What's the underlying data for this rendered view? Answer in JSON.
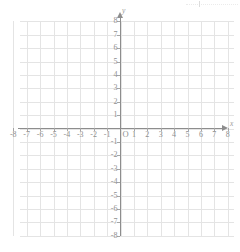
{
  "chart_data": {
    "type": "scatter",
    "title": "",
    "subtitle": "",
    "xlabel": "x",
    "ylabel": "y",
    "xlim": [
      -8,
      8
    ],
    "ylim": [
      -8,
      8
    ],
    "grid": true,
    "legend": null,
    "series": [],
    "x_ticks": [
      -8,
      -7,
      -6,
      -5,
      -4,
      -3,
      -2,
      -1,
      1,
      2,
      3,
      4,
      5,
      6,
      7,
      8
    ],
    "y_ticks": [
      8,
      7,
      6,
      5,
      4,
      3,
      2,
      1,
      -1,
      -2,
      -3,
      -4,
      -5,
      -6,
      -7,
      -8
    ],
    "x_tick_labels": [
      "-8",
      "-7",
      "-6",
      "-5",
      "-4",
      "-3",
      "-2",
      "-1",
      "1",
      "2",
      "3",
      "4",
      "5",
      "6",
      "7",
      "8"
    ],
    "y_tick_labels": [
      "8",
      "7",
      "6",
      "5",
      "4",
      "3",
      "2",
      "1",
      "-1",
      "-2",
      "-3",
      "-4",
      "-5",
      "-6",
      "-7",
      "-8"
    ],
    "origin_label": "O",
    "annotations": [],
    "grid_step": 1,
    "x_axis_arrow": true,
    "y_axis_arrow": true
  },
  "axes": {
    "x_name": "x",
    "y_name": "y",
    "origin": "O"
  },
  "colors": {
    "background": "#ffffff",
    "gridline": "#e4e4e4",
    "axis": "#8d8d8d",
    "tick_label": "#8f8f8f",
    "axis_name": "#9a9a9a",
    "artifact": "#e8e8e8"
  }
}
